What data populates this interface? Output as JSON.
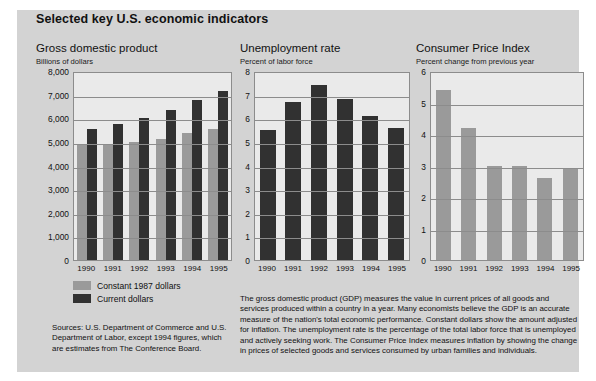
{
  "page": {
    "title": "Selected key U.S. economic indicators"
  },
  "legend": {
    "items": [
      {
        "label": "Constant 1987 dollars",
        "color": "#9a9a9a",
        "swatch": "light"
      },
      {
        "label": "Current dollars",
        "color": "#313131",
        "swatch": "dark"
      }
    ]
  },
  "sources": "Sources: U.S. Department of Commerce and U.S. Department of Labor, except 1994 figures, which are estimates from The Conference Board.",
  "explainer": "The gross domestic product (GDP) measures the value in current prices of all goods and services produced within a country in a year. Many economists believe the GDP is an accurate measure of the nation's total economic performance. Constant dollars show the amount adjusted for inflation. The unemployment rate is the percentage of the total labor force that is unemployed and actively seeking work. The Consumer Price Index measures inflation by showing the change in prices of selected goods and services consumed by urban families and individuals.",
  "chart_data": [
    {
      "id": "gdp",
      "type": "bar",
      "title": "Gross domestic product",
      "subtitle": "Billions of dollars",
      "xlabel": "",
      "ylabel": "Billions of dollars",
      "categories": [
        "1990",
        "1991",
        "1992",
        "1993",
        "1994",
        "1995"
      ],
      "yticks": [
        "0",
        "1,000",
        "2,000",
        "3,000",
        "4,000",
        "5,000",
        "6,000",
        "7,000",
        "8,000"
      ],
      "ylim": [
        0,
        8000
      ],
      "grid": true,
      "legend_position": "below-chart",
      "series": [
        {
          "name": "Constant 1987 dollars",
          "color": "#9a9a9a",
          "values": [
            4900,
            4890,
            5000,
            5140,
            5370,
            5560
          ]
        },
        {
          "name": "Current dollars",
          "color": "#313131",
          "values": [
            5550,
            5750,
            6020,
            6370,
            6780,
            7150
          ]
        }
      ]
    },
    {
      "id": "unemployment",
      "type": "bar",
      "title": "Unemployment rate",
      "subtitle": "Percent of labor force",
      "xlabel": "",
      "ylabel": "Percent of labor force",
      "categories": [
        "1990",
        "1991",
        "1992",
        "1993",
        "1994",
        "1995"
      ],
      "yticks": [
        "0",
        "1",
        "2",
        "3",
        "4",
        "5",
        "6",
        "7",
        "8"
      ],
      "ylim": [
        0,
        8
      ],
      "grid": true,
      "series": [
        {
          "name": "Unemployment rate",
          "color": "#313131",
          "values": [
            5.5,
            6.7,
            7.4,
            6.8,
            6.1,
            5.6
          ]
        }
      ]
    },
    {
      "id": "cpi",
      "type": "bar",
      "title": "Consumer Price Index",
      "subtitle": "Percent change from previous year",
      "xlabel": "",
      "ylabel": "Percent change from previous year",
      "categories": [
        "1990",
        "1991",
        "1992",
        "1993",
        "1994",
        "1995"
      ],
      "yticks": [
        "0",
        "1",
        "2",
        "3",
        "4",
        "5",
        "6"
      ],
      "ylim": [
        0,
        6
      ],
      "grid": true,
      "series": [
        {
          "name": "Consumer Price Index",
          "color": "#9a9a9a",
          "values": [
            5.4,
            4.2,
            3.0,
            3.0,
            2.6,
            2.9
          ]
        }
      ]
    }
  ]
}
